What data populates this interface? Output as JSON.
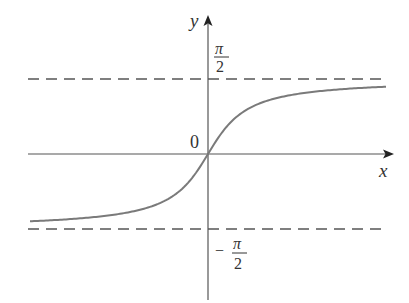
{
  "chart_data": {
    "type": "line",
    "title": "",
    "function": "y = arctan(x)",
    "xlabel": "x",
    "ylabel": "y",
    "origin_label": "0",
    "asymptotes": [
      {
        "name": "upper",
        "value_label": "π/2",
        "style": "dashed"
      },
      {
        "name": "lower",
        "value_label": "−π/2",
        "style": "dashed"
      }
    ],
    "tick_labels": {
      "y_upper_num": "π",
      "y_upper_den": "2",
      "y_lower_sign": "−",
      "y_lower_num": "π",
      "y_lower_den": "2"
    },
    "series": [
      {
        "name": "arctan",
        "x": [
          -6,
          -4,
          -3,
          -2,
          -1,
          -0.5,
          0,
          0.5,
          1,
          2,
          3,
          4,
          6
        ],
        "values": [
          -1.406,
          -1.326,
          -1.249,
          -1.107,
          -0.785,
          -0.464,
          0,
          0.464,
          0.785,
          1.107,
          1.249,
          1.326,
          1.406
        ]
      }
    ],
    "xlim": [
      -6.2,
      6.2
    ],
    "ylim": [
      -2.2,
      2.2
    ],
    "grid": false,
    "legend": null,
    "colors": {
      "curve": "#7a7a7a",
      "axes": "#555555",
      "dash": "#555555"
    }
  }
}
